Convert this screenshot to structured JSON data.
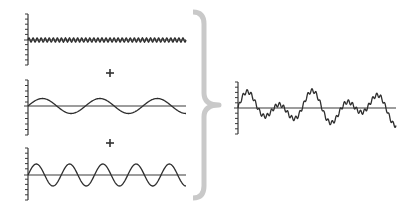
{
  "colors": {
    "line": "#2e2e2e",
    "axis": "#3a3a3a",
    "brace": "#c9c9c9",
    "background": "#ffffff"
  },
  "components": [
    {
      "id": "high-frequency",
      "axis": {
        "x": 28,
        "y_top": 14,
        "y_bottom": 65,
        "baseline_y": 40,
        "x_end": 186,
        "ticks": 10
      },
      "wave": {
        "amplitude": 2.2,
        "cycles": 39,
        "phase": 0
      }
    },
    {
      "id": "low-frequency",
      "axis": {
        "x": 28,
        "y_top": 80,
        "y_bottom": 135,
        "baseline_y": 106,
        "x_end": 186,
        "ticks": 10
      },
      "wave": {
        "amplitude": 7.5,
        "cycles": 2.75,
        "phase": 0
      }
    },
    {
      "id": "mid-frequency",
      "axis": {
        "x": 28,
        "y_top": 148,
        "y_bottom": 200,
        "baseline_y": 175,
        "x_end": 186,
        "ticks": 10
      },
      "wave": {
        "amplitude": 11,
        "cycles": 4.75,
        "phase": 0
      }
    }
  ],
  "operators": [
    {
      "symbol": "+",
      "x": 110,
      "y": 73
    },
    {
      "symbol": "+",
      "x": 110,
      "y": 143
    }
  ],
  "brace": {
    "x_left": 193,
    "x_right": 219,
    "y_top": 12,
    "y_mid": 105,
    "y_bottom": 198
  },
  "result": {
    "id": "composite",
    "axis": {
      "x": 238,
      "y_top": 82,
      "y_bottom": 134,
      "baseline_y": 108,
      "x_end": 396,
      "ticks": 10
    },
    "wave_scale": 0.95
  }
}
